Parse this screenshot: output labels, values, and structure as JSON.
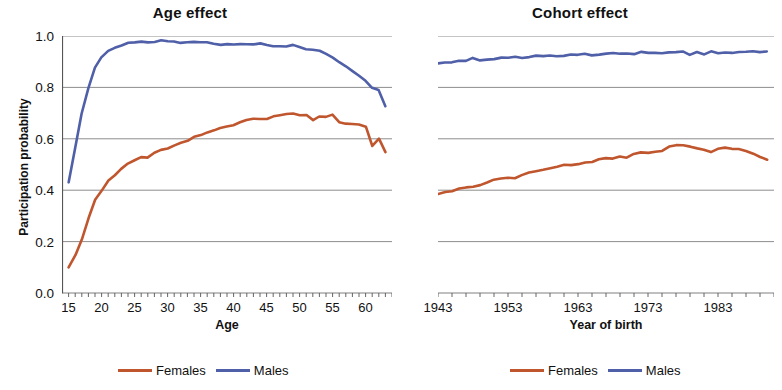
{
  "figure": {
    "background": "#ffffff",
    "series_colors": {
      "females": "#C0562E",
      "males": "#4F5FA8"
    },
    "gridline_color": "#808080",
    "axis_color": "#555555"
  },
  "panels": [
    {
      "id": "age-effect",
      "title": "Age effect",
      "ylabel": "Participation probability",
      "xlabel": "Age",
      "yticks": [
        "0.0",
        "0.2",
        "0.4",
        "0.6",
        "0.8",
        "1.0"
      ],
      "xticks": [
        "15",
        "20",
        "25",
        "30",
        "35",
        "40",
        "45",
        "50",
        "55",
        "60"
      ],
      "legend": [
        {
          "label": "Females",
          "color": "#C0562E"
        },
        {
          "label": "Males",
          "color": "#4F5FA8"
        }
      ]
    },
    {
      "id": "cohort-effect",
      "title": "Cohort effect",
      "ylabel": "",
      "xlabel": "Year of birth",
      "yticks": [],
      "xticks": [
        "1943",
        "1953",
        "1963",
        "1973",
        "1983"
      ],
      "legend": [
        {
          "label": "Females",
          "color": "#C0562E"
        },
        {
          "label": "Males",
          "color": "#4F5FA8"
        }
      ]
    }
  ],
  "chart_data": [
    {
      "type": "line",
      "title": "Age effect",
      "xlabel": "Age",
      "ylabel": "Participation probability",
      "xlim": [
        14,
        64
      ],
      "ylim": [
        0.0,
        1.0
      ],
      "yticks": [
        0.0,
        0.2,
        0.4,
        0.6,
        0.8,
        1.0
      ],
      "xticks": [
        15,
        20,
        25,
        30,
        35,
        40,
        45,
        50,
        55,
        60
      ],
      "grid": "horizontal",
      "legend_position": "bottom",
      "x": [
        15,
        16,
        17,
        18,
        19,
        20,
        21,
        22,
        23,
        24,
        25,
        26,
        27,
        28,
        29,
        30,
        31,
        32,
        33,
        34,
        35,
        36,
        37,
        38,
        39,
        40,
        41,
        42,
        43,
        44,
        45,
        46,
        47,
        48,
        49,
        50,
        51,
        52,
        53,
        54,
        55,
        56,
        57,
        58,
        59,
        60,
        61,
        62,
        63
      ],
      "series": [
        {
          "name": "Females",
          "color": "#C0562E",
          "values": [
            0.1,
            0.15,
            0.21,
            0.29,
            0.36,
            0.4,
            0.44,
            0.46,
            0.48,
            0.5,
            0.52,
            0.53,
            0.53,
            0.545,
            0.555,
            0.565,
            0.575,
            0.585,
            0.59,
            0.605,
            0.615,
            0.625,
            0.635,
            0.64,
            0.645,
            0.655,
            0.665,
            0.675,
            0.675,
            0.675,
            0.68,
            0.69,
            0.695,
            0.695,
            0.695,
            0.695,
            0.695,
            0.675,
            0.685,
            0.685,
            0.695,
            0.665,
            0.66,
            0.655,
            0.655,
            0.65,
            0.575,
            0.6,
            0.545
          ]
        },
        {
          "name": "Males",
          "color": "#4F5FA8",
          "values": [
            0.43,
            0.56,
            0.7,
            0.8,
            0.875,
            0.915,
            0.94,
            0.955,
            0.965,
            0.972,
            0.975,
            0.977,
            0.977,
            0.978,
            0.982,
            0.978,
            0.976,
            0.976,
            0.976,
            0.975,
            0.974,
            0.973,
            0.972,
            0.968,
            0.966,
            0.965,
            0.968,
            0.97,
            0.97,
            0.968,
            0.965,
            0.962,
            0.962,
            0.96,
            0.962,
            0.955,
            0.952,
            0.95,
            0.945,
            0.93,
            0.915,
            0.9,
            0.885,
            0.865,
            0.845,
            0.825,
            0.8,
            0.79,
            0.73
          ]
        }
      ]
    },
    {
      "type": "line",
      "title": "Cohort effect",
      "xlabel": "Year of birth",
      "ylabel": "",
      "xlim": [
        1943,
        1991
      ],
      "ylim": [
        0.0,
        1.0
      ],
      "yticks": [
        0.0,
        0.2,
        0.4,
        0.6,
        0.8,
        1.0
      ],
      "xticks": [
        1943,
        1953,
        1963,
        1973,
        1983
      ],
      "grid": "horizontal",
      "legend_position": "bottom",
      "x": [
        1943,
        1944,
        1945,
        1946,
        1947,
        1948,
        1949,
        1950,
        1951,
        1952,
        1953,
        1954,
        1955,
        1956,
        1957,
        1958,
        1959,
        1960,
        1961,
        1962,
        1963,
        1964,
        1965,
        1966,
        1967,
        1968,
        1969,
        1970,
        1971,
        1972,
        1973,
        1974,
        1975,
        1976,
        1977,
        1978,
        1979,
        1980,
        1981,
        1982,
        1983,
        1984,
        1985,
        1986,
        1987,
        1988,
        1989,
        1990
      ],
      "series": [
        {
          "name": "Females",
          "color": "#C0562E",
          "values": [
            0.385,
            0.395,
            0.398,
            0.405,
            0.408,
            0.415,
            0.422,
            0.432,
            0.438,
            0.442,
            0.452,
            0.448,
            0.462,
            0.468,
            0.472,
            0.482,
            0.486,
            0.492,
            0.497,
            0.495,
            0.502,
            0.508,
            0.512,
            0.518,
            0.522,
            0.525,
            0.532,
            0.528,
            0.538,
            0.545,
            0.548,
            0.552,
            0.556,
            0.568,
            0.572,
            0.578,
            0.572,
            0.565,
            0.556,
            0.548,
            0.562,
            0.566,
            0.562,
            0.558,
            0.552,
            0.545,
            0.532,
            0.518
          ]
        },
        {
          "name": "Males",
          "color": "#4F5FA8",
          "values": [
            0.893,
            0.896,
            0.899,
            0.906,
            0.901,
            0.913,
            0.903,
            0.909,
            0.912,
            0.914,
            0.915,
            0.918,
            0.916,
            0.919,
            0.922,
            0.92,
            0.921,
            0.924,
            0.923,
            0.926,
            0.925,
            0.928,
            0.927,
            0.93,
            0.929,
            0.932,
            0.931,
            0.934,
            0.932,
            0.935,
            0.934,
            0.936,
            0.935,
            0.937,
            0.934,
            0.938,
            0.93,
            0.941,
            0.931,
            0.94,
            0.932,
            0.938,
            0.937,
            0.939,
            0.938,
            0.94,
            0.939,
            0.94
          ]
        }
      ]
    }
  ]
}
